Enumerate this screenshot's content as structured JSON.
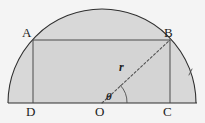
{
  "figure": {
    "labels": {
      "A": "A",
      "B": "B",
      "C": "C",
      "D": "D",
      "O": "O",
      "radius": "r",
      "angle": "θ"
    },
    "colors": {
      "background": "#f4f4f4",
      "region_fill": "#d8d8d8",
      "stroke": "#3a3a3a",
      "dashed_stroke": "#555555",
      "label_color": "#1c1c1c"
    },
    "geometry": {
      "center_x": 102,
      "center_y": 103,
      "radius": 94,
      "baseline_y": 103,
      "baseline_x_start": 8,
      "baseline_x_end": 197,
      "rect_left": 33,
      "rect_right": 170,
      "rect_top": 40,
      "rect_bottom": 103,
      "angle_degrees": 43
    }
  }
}
